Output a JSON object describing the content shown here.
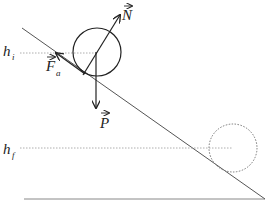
{
  "diagram": {
    "labels": {
      "normal_force": "N",
      "friction_force": "F",
      "friction_subscript": "a",
      "weight": "P",
      "initial_height": "h",
      "initial_subscript": "i",
      "final_height": "h",
      "final_subscript": "f"
    },
    "colors": {
      "line": "#222222",
      "incline": "#555555",
      "dotted": "#777777"
    }
  }
}
